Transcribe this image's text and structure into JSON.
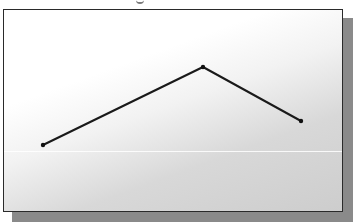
{
  "figure": {
    "frame": {
      "x": 3,
      "y": 9,
      "width": 340,
      "height": 203,
      "shadow_offset": 10
    },
    "colors": {
      "border": "#2a2a2a",
      "shadow": "#8a8a8a",
      "line": "#1a1a1a",
      "background_start": "#ffffff",
      "background_end": "#cdcdcd"
    },
    "polyline": {
      "points": [
        {
          "x": 43,
          "y": 145
        },
        {
          "x": 203,
          "y": 67
        },
        {
          "x": 301,
          "y": 121
        }
      ],
      "points_attr": "43,145 203,67 301,121"
    }
  }
}
